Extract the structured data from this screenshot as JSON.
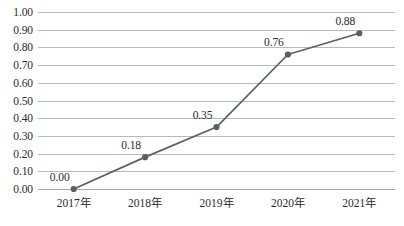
{
  "chart_data": {
    "type": "line",
    "title": "",
    "subtitle": "",
    "xlabel": "",
    "ylabel": "",
    "categories": [
      "2017年",
      "2018年",
      "2019年",
      "2020年",
      "2021年"
    ],
    "values": [
      0.0,
      0.18,
      0.35,
      0.76,
      0.88
    ],
    "point_labels": [
      "0.00",
      "0.18",
      "0.35",
      "0.76",
      "0.88"
    ],
    "series": [
      {
        "name": "",
        "values": [
          0.0,
          0.18,
          0.35,
          0.76,
          0.88
        ]
      }
    ],
    "ylim": [
      0.0,
      1.0
    ],
    "ytick_step": 0.1,
    "ytick_labels": [
      "1.00",
      "0.90",
      "0.80",
      "0.70",
      "0.60",
      "0.50",
      "0.40",
      "0.30",
      "0.20",
      "0.10",
      "0.00"
    ],
    "ytick_values": [
      1.0,
      0.9,
      0.8,
      0.7,
      0.6,
      0.5,
      0.4,
      0.3,
      0.2,
      0.1,
      0.0
    ],
    "grid": true,
    "grid_axis": "horizontal",
    "legend": false,
    "legend_position": "none",
    "markers": true,
    "marker_shape": "circle",
    "data_labels_shown": true
  },
  "style": {
    "line_color": "#5a6068",
    "marker_color": "#595f66",
    "grid_color": "#b9b9b9",
    "axis_color": "#a8a8a8",
    "text_color": "#2b2b2b",
    "background": "#ffffff"
  }
}
